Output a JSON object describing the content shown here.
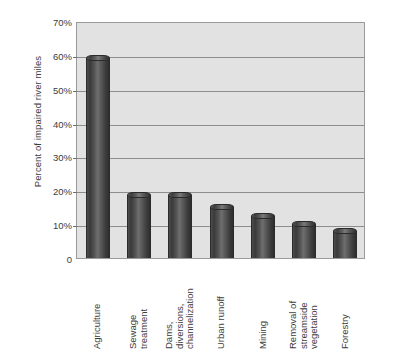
{
  "chart_data": {
    "type": "bar",
    "title": "",
    "xlabel": "",
    "ylabel": "Percent of impaired river miles",
    "ylim": [
      0,
      70
    ],
    "grid": true,
    "legend": "none",
    "orientation": "vertical",
    "bar_style": "3d-cylinder",
    "categories": [
      "Agriculture",
      "Sewage treatment",
      "Dams, diversions, channelization",
      "Urban runoff",
      "Mining",
      "Removal of streamside vegetation",
      "Forestry"
    ],
    "category_label_lines": [
      [
        "Agriculture"
      ],
      [
        "Sewage",
        "treatment"
      ],
      [
        "Dams,",
        "diversions,",
        "channelization"
      ],
      [
        "Urban runoff"
      ],
      [
        "Mining"
      ],
      [
        "Removal of",
        "streamside",
        "vegetation"
      ],
      [
        "Forestry"
      ]
    ],
    "values": [
      59,
      18.5,
      18.5,
      15,
      12.5,
      10,
      8
    ],
    "yticks": [
      0,
      10,
      20,
      30,
      40,
      50,
      60,
      70
    ],
    "ytick_labels": [
      "0",
      "10%",
      "20%",
      "30%",
      "40%",
      "50%",
      "60%",
      "70%"
    ]
  },
  "colors": {
    "plot_background": "#e2e2e2",
    "page_background": "#ffffff",
    "gridline": "#8d8d8d",
    "axis_border": "#9a9a9a",
    "bar_dark": "#2e2e2e",
    "bar_highlight": "#7a7a7a",
    "text": "#3c3c3c"
  }
}
